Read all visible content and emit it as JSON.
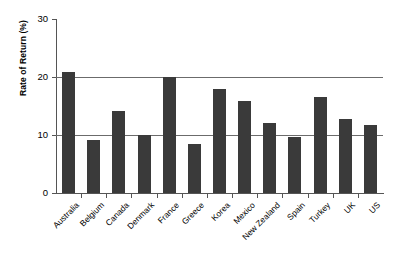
{
  "chart_data": {
    "type": "bar",
    "title": "",
    "xlabel": "",
    "ylabel": "Rate of Return (%)",
    "ylim": [
      0,
      30
    ],
    "yticks": [
      0,
      10,
      20,
      30
    ],
    "ytick_labels": [
      "0",
      "10",
      "20",
      "30"
    ],
    "grid": "horizontal",
    "legend": "none",
    "bar_color": "#3a3a3a",
    "categories": [
      "Australia",
      "Belgium",
      "Canada",
      "Denmark",
      "France",
      "Greece",
      "Korea",
      "Mexico",
      "New Zealand",
      "Spain",
      "Turkey",
      "UK",
      "US"
    ],
    "values": [
      20.8,
      9.2,
      14.2,
      10.0,
      20.0,
      8.4,
      18.0,
      15.8,
      12.1,
      9.6,
      16.5,
      12.8,
      11.7
    ]
  }
}
